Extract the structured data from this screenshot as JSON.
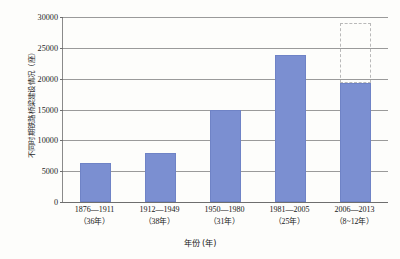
{
  "chart_data": {
    "type": "bar",
    "title": "",
    "subtitle": "",
    "xlabel": "年份 (年)",
    "ylabel": "不同时期铁路桥梁建设情况（座）",
    "categories": [
      "1876—1911",
      "1912—1949",
      "1950—1980",
      "1981—2005",
      "2006—2013"
    ],
    "category_sublabels": [
      "（36年）",
      "（38年）",
      "（31年）",
      "（25年）",
      "（8~12年）"
    ],
    "values": [
      6300,
      7900,
      15000,
      23900,
      19300
    ],
    "ylim": [
      0,
      30000
    ],
    "ytick_labels": [
      "0",
      "5000",
      "10000",
      "15000",
      "20000",
      "25000",
      "30000"
    ],
    "ytick_values": [
      0,
      5000,
      10000,
      15000,
      20000,
      25000,
      30000
    ],
    "grid": true,
    "legend": "none",
    "bar_color": "#7b8fd1",
    "annotations": [
      {
        "name": "projected-extension",
        "category": "2006—2013",
        "style": "dashed-outline",
        "from": 19300,
        "to": 29000,
        "color": "#b9b9b9"
      }
    ]
  }
}
